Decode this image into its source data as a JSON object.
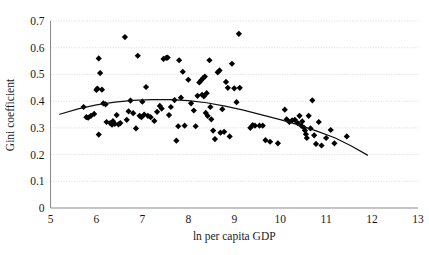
{
  "chart_data": {
    "type": "scatter",
    "title": "",
    "xlabel": "ln per capita GDP",
    "ylabel": "Gini coefficient",
    "xlim": [
      5,
      13
    ],
    "ylim": [
      0,
      0.7
    ],
    "xticks": [
      "5",
      "6",
      "7",
      "8",
      "9",
      "10",
      "11",
      "12",
      "13"
    ],
    "xtick_values": [
      5,
      6,
      7,
      8,
      9,
      10,
      11,
      12,
      13
    ],
    "yticks": [
      "0",
      "0.1",
      "0.2",
      "0.3",
      "0.4",
      "0.5",
      "0.6",
      "0.7"
    ],
    "ytick_values": [
      0,
      0.1,
      0.2,
      0.3,
      0.4,
      0.5,
      0.6,
      0.7
    ],
    "grid": "horizontal-dotted",
    "legend": "none",
    "marker": "filled-diamond",
    "marker_color": "#000000",
    "trend_color": "#111111",
    "series": [
      {
        "name": "countries",
        "points": [
          [
            5.72,
            0.378
          ],
          [
            5.78,
            0.34
          ],
          [
            5.82,
            0.338
          ],
          [
            5.88,
            0.345
          ],
          [
            5.95,
            0.352
          ],
          [
            6.0,
            0.442
          ],
          [
            6.02,
            0.447
          ],
          [
            6.05,
            0.56
          ],
          [
            6.05,
            0.275
          ],
          [
            6.08,
            0.505
          ],
          [
            6.12,
            0.443
          ],
          [
            6.15,
            0.392
          ],
          [
            6.2,
            0.388
          ],
          [
            6.22,
            0.322
          ],
          [
            6.3,
            0.318
          ],
          [
            6.34,
            0.312
          ],
          [
            6.36,
            0.325
          ],
          [
            6.4,
            0.315
          ],
          [
            6.44,
            0.348
          ],
          [
            6.48,
            0.313
          ],
          [
            6.52,
            0.318
          ],
          [
            6.62,
            0.64
          ],
          [
            6.66,
            0.33
          ],
          [
            6.7,
            0.362
          ],
          [
            6.74,
            0.402
          ],
          [
            6.8,
            0.355
          ],
          [
            6.86,
            0.298
          ],
          [
            6.9,
            0.57
          ],
          [
            6.94,
            0.345
          ],
          [
            6.98,
            0.34
          ],
          [
            7.0,
            0.398
          ],
          [
            7.04,
            0.35
          ],
          [
            7.08,
            0.453
          ],
          [
            7.12,
            0.345
          ],
          [
            7.18,
            0.34
          ],
          [
            7.26,
            0.326
          ],
          [
            7.32,
            0.36
          ],
          [
            7.38,
            0.382
          ],
          [
            7.42,
            0.372
          ],
          [
            7.46,
            0.558
          ],
          [
            7.52,
            0.562
          ],
          [
            7.55,
            0.563
          ],
          [
            7.58,
            0.348
          ],
          [
            7.62,
            0.378
          ],
          [
            7.7,
            0.404
          ],
          [
            7.74,
            0.252
          ],
          [
            7.78,
            0.306
          ],
          [
            7.8,
            0.553
          ],
          [
            7.84,
            0.413
          ],
          [
            7.88,
            0.51
          ],
          [
            7.92,
            0.308
          ],
          [
            8.0,
            0.48
          ],
          [
            8.06,
            0.392
          ],
          [
            8.12,
            0.365
          ],
          [
            8.16,
            0.306
          ],
          [
            8.2,
            0.42
          ],
          [
            8.24,
            0.47
          ],
          [
            8.28,
            0.478
          ],
          [
            8.3,
            0.424
          ],
          [
            8.32,
            0.486
          ],
          [
            8.34,
            0.418
          ],
          [
            8.36,
            0.492
          ],
          [
            8.38,
            0.356
          ],
          [
            8.4,
            0.43
          ],
          [
            8.42,
            0.345
          ],
          [
            8.46,
            0.553
          ],
          [
            8.48,
            0.378
          ],
          [
            8.5,
            0.332
          ],
          [
            8.54,
            0.29
          ],
          [
            8.58,
            0.258
          ],
          [
            8.64,
            0.508
          ],
          [
            8.68,
            0.515
          ],
          [
            8.7,
            0.282
          ],
          [
            8.74,
            0.37
          ],
          [
            8.78,
            0.285
          ],
          [
            8.82,
            0.472
          ],
          [
            8.86,
            0.45
          ],
          [
            8.9,
            0.268
          ],
          [
            8.95,
            0.54
          ],
          [
            9.0,
            0.448
          ],
          [
            9.05,
            0.396
          ],
          [
            9.1,
            0.652
          ],
          [
            9.12,
            0.45
          ],
          [
            9.35,
            0.3
          ],
          [
            9.4,
            0.31
          ],
          [
            9.45,
            0.308
          ],
          [
            9.55,
            0.308
          ],
          [
            9.62,
            0.308
          ],
          [
            9.68,
            0.254
          ],
          [
            9.78,
            0.248
          ],
          [
            9.95,
            0.242
          ],
          [
            10.1,
            0.368
          ],
          [
            10.14,
            0.332
          ],
          [
            10.2,
            0.322
          ],
          [
            10.26,
            0.328
          ],
          [
            10.32,
            0.33
          ],
          [
            10.38,
            0.318
          ],
          [
            10.42,
            0.345
          ],
          [
            10.46,
            0.308
          ],
          [
            10.48,
            0.324
          ],
          [
            10.52,
            0.3
          ],
          [
            10.54,
            0.29
          ],
          [
            10.56,
            0.276
          ],
          [
            10.58,
            0.262
          ],
          [
            10.62,
            0.345
          ],
          [
            10.66,
            0.298
          ],
          [
            10.7,
            0.403
          ],
          [
            10.74,
            0.272
          ],
          [
            10.78,
            0.24
          ],
          [
            10.84,
            0.322
          ],
          [
            10.9,
            0.234
          ],
          [
            11.0,
            0.262
          ],
          [
            11.1,
            0.292
          ],
          [
            11.18,
            0.242
          ],
          [
            11.45,
            0.268
          ]
        ]
      }
    ],
    "trend": {
      "name": "quadratic fit",
      "shape": "inverted-u",
      "x_start": 5.2,
      "x_end": 11.9,
      "points": [
        [
          5.2,
          0.351
        ],
        [
          5.6,
          0.371
        ],
        [
          6.0,
          0.386
        ],
        [
          6.4,
          0.396
        ],
        [
          6.8,
          0.403
        ],
        [
          7.2,
          0.406
        ],
        [
          7.6,
          0.406
        ],
        [
          8.0,
          0.402
        ],
        [
          8.4,
          0.394
        ],
        [
          8.8,
          0.381
        ],
        [
          9.2,
          0.366
        ],
        [
          9.6,
          0.349
        ],
        [
          10.0,
          0.331
        ],
        [
          10.4,
          0.311
        ],
        [
          10.8,
          0.288
        ],
        [
          11.2,
          0.262
        ],
        [
          11.55,
          0.232
        ],
        [
          11.9,
          0.198
        ]
      ]
    }
  }
}
